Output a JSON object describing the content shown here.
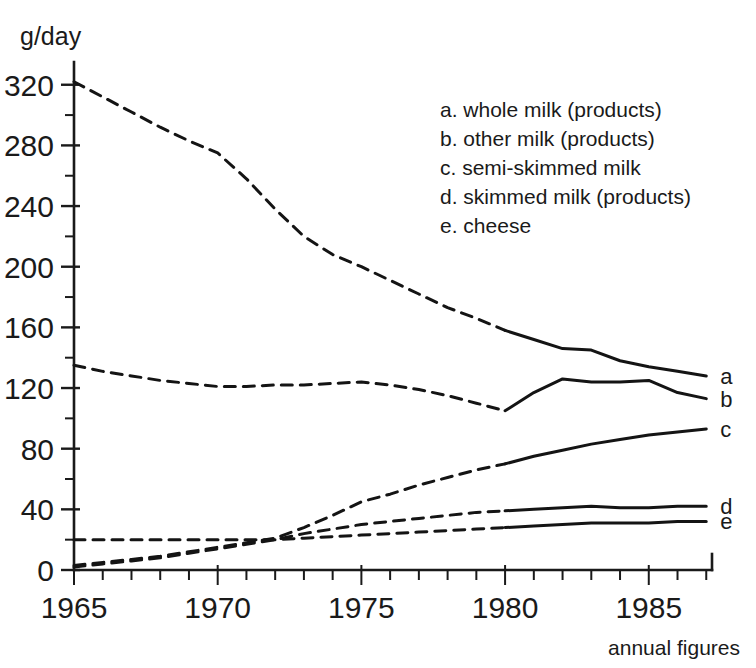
{
  "chart_data": {
    "type": "line",
    "title": "",
    "subtitle": "",
    "xlabel": "annual figures",
    "ylabel": "g/day",
    "xlim": [
      1965,
      1987.2
    ],
    "ylim": [
      0,
      335
    ],
    "grid": false,
    "legend_position": "upper-right-inside",
    "x_ticks_major": [
      1965,
      1970,
      1975,
      1980,
      1985
    ],
    "x_tick_labels": [
      "1965",
      "1970",
      "1975",
      "1980",
      "1985"
    ],
    "x_tick_step_minor": 1,
    "y_ticks_major": [
      0,
      40,
      80,
      120,
      160,
      200,
      240,
      280,
      320
    ],
    "y_tick_labels": [
      "0",
      "40",
      "80",
      "120",
      "160",
      "200",
      "240",
      "280",
      "320"
    ],
    "y_tick_step_minor": 20,
    "dashed_until_year": 1980,
    "note": "Lines are dashed for 1965-1980 (estimated) and solid from 1980-1987 (measured).",
    "x": [
      1965,
      1966,
      1967,
      1968,
      1969,
      1970,
      1971,
      1972,
      1973,
      1974,
      1975,
      1976,
      1977,
      1978,
      1979,
      1980,
      1981,
      1982,
      1983,
      1984,
      1985,
      1986,
      1987
    ],
    "series": [
      {
        "key": "a",
        "name": "whole milk (products)",
        "end_label": "a",
        "values": [
          322,
          312,
          302,
          292,
          283,
          275,
          258,
          238,
          220,
          208,
          200,
          191,
          182,
          173,
          166,
          158,
          152,
          146,
          145,
          138,
          134,
          131,
          128
        ]
      },
      {
        "key": "b",
        "name": "other milk (products)",
        "end_label": "b",
        "values": [
          135,
          131,
          128,
          125,
          123,
          121,
          121,
          122,
          122,
          123,
          124,
          122,
          119,
          115,
          110,
          105,
          117,
          126,
          124,
          124,
          125,
          117,
          113
        ]
      },
      {
        "key": "c",
        "name": "semi-skimmed milk",
        "end_label": "c",
        "values": [
          3,
          5,
          7,
          9,
          12,
          15,
          18,
          21,
          28,
          36,
          45,
          50,
          56,
          61,
          66,
          70,
          75,
          79,
          83,
          86,
          89,
          91,
          93
        ]
      },
      {
        "key": "d",
        "name": "skimmed milk (products)",
        "end_label": "d",
        "values": [
          2,
          4,
          6,
          8,
          11,
          14,
          17,
          20,
          24,
          27,
          30,
          32,
          34,
          36,
          38,
          39,
          40,
          41,
          42,
          41,
          41,
          42,
          42
        ]
      },
      {
        "key": "e",
        "name": "cheese",
        "end_label": "e",
        "values": [
          20,
          20,
          20,
          20,
          20,
          20,
          20,
          20,
          21,
          22,
          23,
          24,
          25,
          26,
          27,
          28,
          29,
          30,
          31,
          31,
          31,
          32,
          32
        ]
      }
    ]
  },
  "legend": {
    "entries": [
      "a. whole milk (products)",
      "b. other milk (products)",
      "c. semi-skimmed milk",
      "d. skimmed milk (products)",
      "e. cheese"
    ]
  },
  "axis": {
    "y_unit_label": "g/day",
    "x_footer_label": "annual figures"
  },
  "colors": {
    "ink": "#1a1a1a",
    "background": "#ffffff"
  }
}
